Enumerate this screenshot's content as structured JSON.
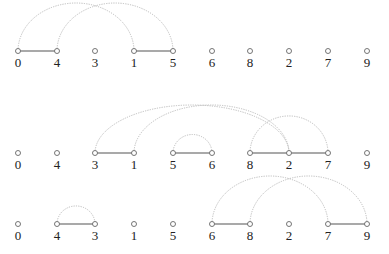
{
  "diagram": {
    "type": "arc-diagram",
    "x_positions": [
      18,
      57,
      95,
      134,
      173,
      212,
      250,
      289,
      328,
      367
    ],
    "rows": [
      {
        "y": 51,
        "order": [
          "0",
          "4",
          "3",
          "1",
          "5",
          "6",
          "8",
          "2",
          "7",
          "9"
        ],
        "solid_edges": [
          [
            0,
            1
          ],
          [
            3,
            4
          ]
        ],
        "arcs": [
          [
            0,
            3
          ],
          [
            1,
            4
          ]
        ]
      },
      {
        "y": 153,
        "order": [
          "0",
          "4",
          "3",
          "1",
          "5",
          "6",
          "8",
          "2",
          "7",
          "9"
        ],
        "solid_edges": [
          [
            2,
            3
          ],
          [
            4,
            5
          ],
          [
            6,
            7
          ],
          [
            7,
            8
          ]
        ],
        "arcs": [
          [
            2,
            7
          ],
          [
            3,
            7
          ],
          [
            4,
            5
          ],
          [
            6,
            8
          ]
        ]
      },
      {
        "y": 224,
        "order": [
          "0",
          "4",
          "3",
          "1",
          "5",
          "6",
          "8",
          "2",
          "7",
          "9"
        ],
        "solid_edges": [
          [
            1,
            2
          ],
          [
            5,
            6
          ],
          [
            8,
            9
          ]
        ],
        "arcs": [
          [
            1,
            2
          ],
          [
            5,
            8
          ],
          [
            6,
            9
          ]
        ]
      }
    ],
    "colors": {
      "edge": "#555555",
      "arc": "#bbbbbb",
      "node_stroke": "#666666"
    }
  }
}
